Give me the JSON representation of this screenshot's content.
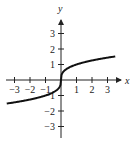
{
  "chart_data": {
    "type": "line",
    "title": "",
    "xlabel": "x",
    "ylabel": "y",
    "xlim": [
      -3.5,
      3.5
    ],
    "ylim": [
      -3.5,
      3.5
    ],
    "grid": false,
    "legend": null,
    "x_ticks": [
      -3,
      -2,
      -1,
      1,
      2,
      3
    ],
    "y_ticks": [
      -3,
      -2,
      -1,
      1,
      2,
      3
    ],
    "x_tick_labels": [
      "−3",
      "−2",
      "−1",
      "1",
      "2",
      "3"
    ],
    "y_tick_labels": [
      "−3",
      "−2",
      "−1",
      "1",
      "2",
      "3"
    ],
    "series": [
      {
        "name": "y = x^(1/3)",
        "x": [
          -3.5,
          -3,
          -2,
          -1,
          -0.5,
          -0.1,
          0,
          0.1,
          0.5,
          1,
          2,
          3,
          3.5
        ],
        "y": [
          -1.52,
          -1.44,
          -1.26,
          -1.0,
          -0.79,
          -0.46,
          0,
          0.46,
          0.79,
          1.0,
          1.26,
          1.44,
          1.52
        ]
      }
    ]
  },
  "labels": {
    "x_axis": "x",
    "y_axis": "y"
  }
}
